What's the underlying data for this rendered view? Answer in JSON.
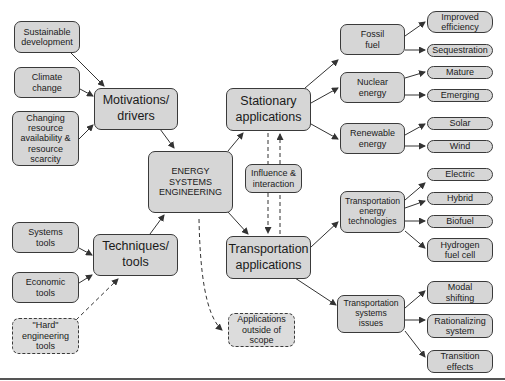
{
  "diagram": {
    "nodes": {
      "sustainable_development": "Sustainable\ndevelopment",
      "climate_change": "Climate\nchange",
      "changing_resource": "Changing\nresource\navailability &\nresource\nscarcity",
      "motivations": "Motivations/\ndrivers",
      "ese": "ENERGY\nSYSTEMS\nENGINEERING",
      "systems_tools": "Systems\ntools",
      "economic_tools": "Economic\ntools",
      "hard_engineering": "\"Hard\"\nengineering\ntools",
      "techniques": "Techniques/\ntools",
      "stationary": "Stationary\napplications",
      "influence": "Influence &\ninteraction",
      "transportation": "Transportation\napplications",
      "outside_scope": "Applications\noutside of\nscope",
      "fossil_fuel": "Fossil\nfuel",
      "nuclear_energy": "Nuclear\nenergy",
      "renewable_energy": "Renewable\nenergy",
      "improved_efficiency": "Improved\nefficiency",
      "sequestration": "Sequestration",
      "mature": "Mature",
      "emerging": "Emerging",
      "solar": "Solar",
      "wind": "Wind",
      "trans_energy_tech": "Transportation\nenergy\ntechnologies",
      "electric": "Electric",
      "hybrid": "Hybrid",
      "biofuel": "Biofuel",
      "hydrogen": "Hydrogen\nfuel cell",
      "trans_systems_issues": "Transportation\nsystems\nissues",
      "modal_shifting": "Modal\nshifting",
      "rationalizing": "Rationalizing\nsystem",
      "transition_effects": "Transition\neffects"
    },
    "colors": {
      "node_fill": "#d6d6d6",
      "node_border": "#3a3a3a",
      "edge": "#333333",
      "background": "#ffffff"
    }
  }
}
